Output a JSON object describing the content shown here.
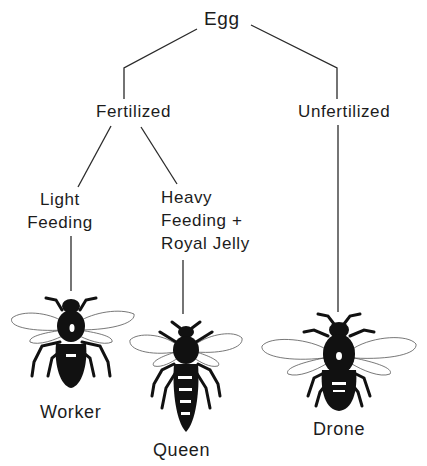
{
  "diagram": {
    "nodes": {
      "egg": {
        "label": "Egg"
      },
      "fertilized": {
        "label": "Fertilized"
      },
      "unfertilized": {
        "label": "Unfertilized"
      },
      "light_feeding": {
        "label": "Light\nFeeding"
      },
      "heavy_feeding": {
        "label": "Heavy\nFeeding +\nRoyal Jelly"
      },
      "worker": {
        "label": "Worker",
        "icon": "worker-bee-icon"
      },
      "queen": {
        "label": "Queen",
        "icon": "queen-bee-icon"
      },
      "drone": {
        "label": "Drone",
        "icon": "drone-bee-icon"
      }
    },
    "edges": [
      {
        "from": "Egg",
        "to": "Fertilized"
      },
      {
        "from": "Egg",
        "to": "Unfertilized"
      },
      {
        "from": "Fertilized",
        "to": "Light Feeding"
      },
      {
        "from": "Fertilized",
        "to": "Heavy Feeding + Royal Jelly"
      },
      {
        "from": "Light Feeding",
        "to": "Worker"
      },
      {
        "from": "Heavy Feeding + Royal Jelly",
        "to": "Queen"
      },
      {
        "from": "Unfertilized",
        "to": "Drone"
      }
    ],
    "colors": {
      "ink": "#1c1c1c",
      "background": "#ffffff",
      "wing": "#555555"
    }
  }
}
